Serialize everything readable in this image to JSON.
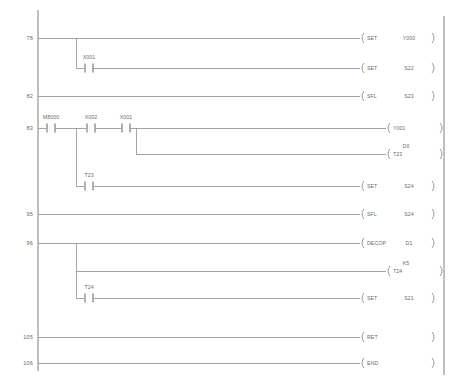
{
  "diagram": {
    "type": "plc-ladder-diagram",
    "left_rail_x": 38,
    "right_rail_x": 444,
    "line_color": "#9a9a9a",
    "text_color": "#6b6b6b",
    "background": "#ffffff"
  },
  "rungs": [
    {
      "step": "78",
      "y": 38,
      "elements": [
        {
          "kind": "instruction",
          "name": "SET",
          "operand": "Y000"
        }
      ]
    },
    {
      "step": "",
      "y": 68,
      "elements": [
        {
          "kind": "contact",
          "name": "X001",
          "type": "no"
        },
        {
          "kind": "instruction",
          "name": "SET",
          "operand": "S22"
        }
      ]
    },
    {
      "step": "82",
      "y": 96,
      "elements": [
        {
          "kind": "instruction",
          "name": "SFL",
          "operand": "S23"
        }
      ]
    },
    {
      "step": "83",
      "y": 128,
      "elements": [
        {
          "kind": "contact",
          "name": "M8000",
          "type": "no"
        },
        {
          "kind": "contact",
          "name": "X002",
          "type": "no"
        },
        {
          "kind": "contact",
          "name": "X001",
          "type": "no"
        },
        {
          "kind": "coil",
          "name": "Y001"
        }
      ]
    },
    {
      "step": "",
      "y": 154,
      "elements": [
        {
          "kind": "coil",
          "name": "T23",
          "above": "D0"
        }
      ]
    },
    {
      "step": "",
      "y": 186,
      "elements": [
        {
          "kind": "contact",
          "name": "T23",
          "type": "no"
        },
        {
          "kind": "instruction",
          "name": "SET",
          "operand": "S24"
        }
      ]
    },
    {
      "step": "95",
      "y": 214,
      "elements": [
        {
          "kind": "instruction",
          "name": "SFL",
          "operand": "S24"
        }
      ]
    },
    {
      "step": "96",
      "y": 243,
      "elements": [
        {
          "kind": "instruction",
          "name": "DECOP",
          "operand": "D1"
        }
      ]
    },
    {
      "step": "",
      "y": 271,
      "elements": [
        {
          "kind": "coil",
          "name": "T24",
          "above": "K5"
        }
      ]
    },
    {
      "step": "",
      "y": 298,
      "elements": [
        {
          "kind": "contact",
          "name": "T24",
          "type": "no"
        },
        {
          "kind": "instruction",
          "name": "SET",
          "operand": "S21"
        }
      ]
    },
    {
      "step": "105",
      "y": 337,
      "elements": [
        {
          "kind": "instruction",
          "name": "RET",
          "operand": ""
        }
      ]
    },
    {
      "step": "106",
      "y": 363,
      "elements": [
        {
          "kind": "instruction",
          "name": "END",
          "operand": ""
        }
      ]
    }
  ],
  "step_numbers": {
    "s78": "78",
    "s82": "82",
    "s83": "83",
    "s95": "95",
    "s96": "96",
    "s105": "105",
    "s106": "106"
  },
  "contacts": {
    "c_x001_a": "X001",
    "c_m8000": "M8000",
    "c_x002": "X002",
    "c_x001_b": "X001",
    "c_t23": "T23",
    "c_t24": "T24"
  },
  "instructions": {
    "i_set_y000": "SET",
    "i_set_s22": "SET",
    "i_sfl_s23": "SFL",
    "i_set_s24": "SET",
    "i_sfl_s24": "SFL",
    "i_decop_d1": "DECOP",
    "i_set_s21": "SET",
    "i_ret": "RET",
    "i_end": "END"
  },
  "operands": {
    "o_y000": "Y000",
    "o_s22": "S22",
    "o_s23": "S23",
    "o_s24a": "S24",
    "o_s24b": "S24",
    "o_d1": "D1",
    "o_s21": "S21"
  },
  "coils": {
    "k_y001": "Y001",
    "k_t23": "T23",
    "k_t23_above": "D0",
    "k_t24": "T24",
    "k_t24_above": "K5"
  }
}
